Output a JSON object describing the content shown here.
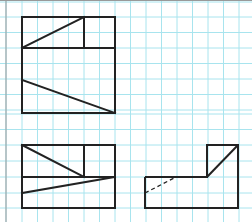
{
  "diagram": {
    "type": "orthographic-projection",
    "grid": {
      "spacing": 15.5,
      "color": "#a8e4ee",
      "border_color": "#999999"
    },
    "line_color": "#222222",
    "views": [
      {
        "name": "top-view",
        "label": ""
      },
      {
        "name": "front-view",
        "label": ""
      },
      {
        "name": "side-view",
        "label": ""
      }
    ]
  }
}
